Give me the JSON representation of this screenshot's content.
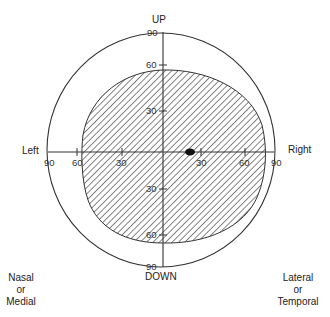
{
  "diagram": {
    "type": "visual-field-chart",
    "directions": {
      "up": "UP",
      "down": "DOWN",
      "left": "Left",
      "right": "Right"
    },
    "corner_labels": {
      "bottom_left": [
        "Nasal",
        "or",
        "Medial"
      ],
      "bottom_right": [
        "Lateral",
        "or",
        "Temporal"
      ]
    },
    "axis_ticks": {
      "up": [
        "90",
        "60",
        "30"
      ],
      "down": [
        "30",
        "60",
        "90"
      ],
      "left": [
        "90",
        "60",
        "30"
      ],
      "right": [
        "30",
        "60",
        "90"
      ]
    },
    "regions": [
      {
        "name": "visual-field",
        "fill": "diagonal-hatch",
        "extent_deg": {
          "up": 55,
          "down": 60,
          "left": 57,
          "right": 75
        }
      },
      {
        "name": "blind-spot",
        "fill": "solid-black",
        "position_deg": {
          "x": 25,
          "y": 0
        }
      }
    ],
    "colors": {
      "line": "#333333",
      "hatch": "#444444",
      "background": "#ffffff"
    }
  }
}
